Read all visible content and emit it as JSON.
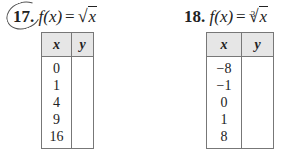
{
  "problems": [
    {
      "number": "17.",
      "lhs": "f(x)",
      "equals": "=",
      "radical_symbol": "√",
      "radical_index": "",
      "radicand": "x",
      "circled": true,
      "table": {
        "headers": [
          "x",
          "y"
        ],
        "x_values": [
          "0",
          "1",
          "4",
          "9",
          "16"
        ],
        "y_values": [
          "",
          "",
          "",
          "",
          ""
        ]
      }
    },
    {
      "number": "18.",
      "lhs": "f(x)",
      "equals": "=",
      "radical_symbol": "√",
      "radical_index": "3",
      "radicand": "x",
      "circled": false,
      "table": {
        "headers": [
          "x",
          "y"
        ],
        "x_values": [
          "−8",
          "−1",
          "0",
          "1",
          "8"
        ],
        "y_values": [
          "",
          "",
          "",
          "",
          ""
        ]
      }
    }
  ]
}
